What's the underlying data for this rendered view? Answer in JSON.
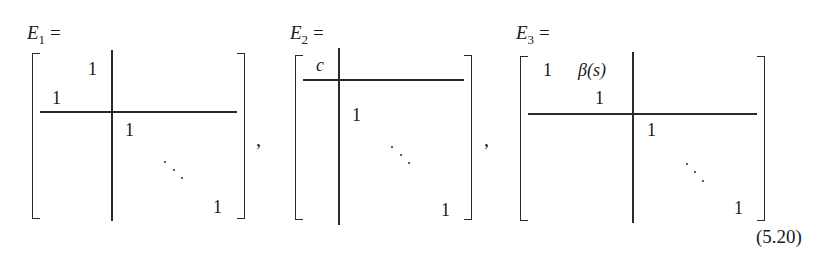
{
  "equation_number": "(5.20)",
  "separator": ",",
  "ellipsis": "⋱",
  "matrices": [
    {
      "name": "E",
      "subscript": "1",
      "equals": "=",
      "entries": {
        "top_right_of_block": "1",
        "bottom_left_of_block": "1",
        "identity_first": "1",
        "identity_last": "1"
      }
    },
    {
      "name": "E",
      "subscript": "2",
      "equals": "=",
      "entries": {
        "corner": "c",
        "identity_first": "1",
        "identity_last": "1"
      }
    },
    {
      "name": "E",
      "subscript": "3",
      "equals": "=",
      "entries": {
        "top_left": "1",
        "top_right": "β(s)",
        "second_diag": "1",
        "identity_first": "1",
        "identity_last": "1"
      }
    }
  ]
}
